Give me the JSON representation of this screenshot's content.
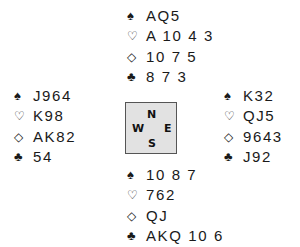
{
  "suits": {
    "spades": "♠",
    "hearts": "♡",
    "diamonds": "◇",
    "clubs": "♣"
  },
  "compass": {
    "north": "N",
    "south": "S",
    "west": "W",
    "east": "E"
  },
  "hands": {
    "north": {
      "spades": "AQ5",
      "hearts": "A 10 4 3",
      "diamonds": "10 7 5",
      "clubs": "8 7 3"
    },
    "west": {
      "spades": "J964",
      "hearts": "K98",
      "diamonds": "AK82",
      "clubs": "54"
    },
    "east": {
      "spades": "K32",
      "hearts": "QJ5",
      "diamonds": "9643",
      "clubs": "J92"
    },
    "south": {
      "spades": "10 8 7",
      "hearts": "762",
      "diamonds": "QJ",
      "clubs": "AKQ 10 6"
    }
  },
  "colors": {
    "text": "#1a1a1a",
    "compass_bg": "#e2e2e2",
    "compass_border": "#555555"
  }
}
